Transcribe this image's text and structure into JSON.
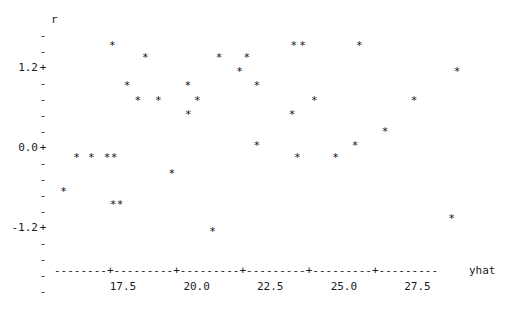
{
  "chart_data": {
    "type": "scatter",
    "title": "",
    "xlabel": "yhat",
    "ylabel": "r",
    "marker": "*",
    "xlim": [
      15.6,
      29.6
    ],
    "ylim": [
      -2.05,
      1.85
    ],
    "xticks": [
      17.5,
      20.0,
      22.5,
      25.0,
      27.5
    ],
    "xtick_labels": [
      "17.5",
      "20.0",
      "22.5",
      "25.0",
      "27.5"
    ],
    "yticks": [
      1.2,
      0.0,
      -1.2
    ],
    "ytick_labels": [
      "1.2+",
      "0.0+",
      "-1.2+"
    ],
    "y_minor_tick_mark": "-",
    "y_major_tick_mark": "+",
    "grid": false,
    "legend": null,
    "axis_line_style": "dashed-ascii",
    "points": [
      {
        "x": 17.14,
        "y": 1.54
      },
      {
        "x": 18.26,
        "y": 1.32
      },
      {
        "x": 20.76,
        "y": 1.32
      },
      {
        "x": 21.7,
        "y": 1.32
      },
      {
        "x": 23.3,
        "y": 1.54
      },
      {
        "x": 23.6,
        "y": 1.54
      },
      {
        "x": 25.52,
        "y": 1.54
      },
      {
        "x": 28.84,
        "y": 1.06
      },
      {
        "x": 21.46,
        "y": 1.06
      },
      {
        "x": 19.7,
        "y": 0.8
      },
      {
        "x": 17.64,
        "y": 0.8
      },
      {
        "x": 22.04,
        "y": 0.8
      },
      {
        "x": 18.0,
        "y": 0.52
      },
      {
        "x": 18.7,
        "y": 0.52
      },
      {
        "x": 20.02,
        "y": 0.52
      },
      {
        "x": 24.0,
        "y": 0.52
      },
      {
        "x": 27.38,
        "y": 0.52
      },
      {
        "x": 19.72,
        "y": 0.26
      },
      {
        "x": 23.24,
        "y": 0.26
      },
      {
        "x": 26.4,
        "y": -0.06
      },
      {
        "x": 22.04,
        "y": -0.32
      },
      {
        "x": 25.38,
        "y": -0.32
      },
      {
        "x": 15.92,
        "y": -0.56
      },
      {
        "x": 16.42,
        "y": -0.56
      },
      {
        "x": 16.96,
        "y": -0.56
      },
      {
        "x": 17.2,
        "y": -0.56
      },
      {
        "x": 23.42,
        "y": -0.56
      },
      {
        "x": 24.72,
        "y": -0.56
      },
      {
        "x": 19.16,
        "y": -0.86
      },
      {
        "x": 15.48,
        "y": -1.2
      },
      {
        "x": 17.16,
        "y": -1.44
      },
      {
        "x": 17.4,
        "y": -1.44
      },
      {
        "x": 20.54,
        "y": -1.94
      },
      {
        "x": 28.66,
        "y": -1.7
      }
    ]
  },
  "axes": {
    "y_axis_name": "r",
    "x_axis_name": "yhat",
    "x_axis_ascii": "--------+---------+---------+---------+---------+---------",
    "y_rows": [
      {
        "label": "",
        "mark": "-"
      },
      {
        "label": "",
        "mark": "-"
      },
      {
        "label": "1.2",
        "mark": "+"
      },
      {
        "label": "",
        "mark": "-"
      },
      {
        "label": "",
        "mark": "-"
      },
      {
        "label": "",
        "mark": "-"
      },
      {
        "label": "",
        "mark": "-"
      },
      {
        "label": "0.0",
        "mark": "+"
      },
      {
        "label": "",
        "mark": "-"
      },
      {
        "label": "",
        "mark": "-"
      },
      {
        "label": "",
        "mark": "-"
      },
      {
        "label": "",
        "mark": "-"
      },
      {
        "label": "-1.2",
        "mark": "+"
      },
      {
        "label": "",
        "mark": "-"
      },
      {
        "label": "",
        "mark": "-"
      },
      {
        "label": "",
        "mark": "-"
      },
      {
        "label": "",
        "mark": "-"
      }
    ]
  }
}
